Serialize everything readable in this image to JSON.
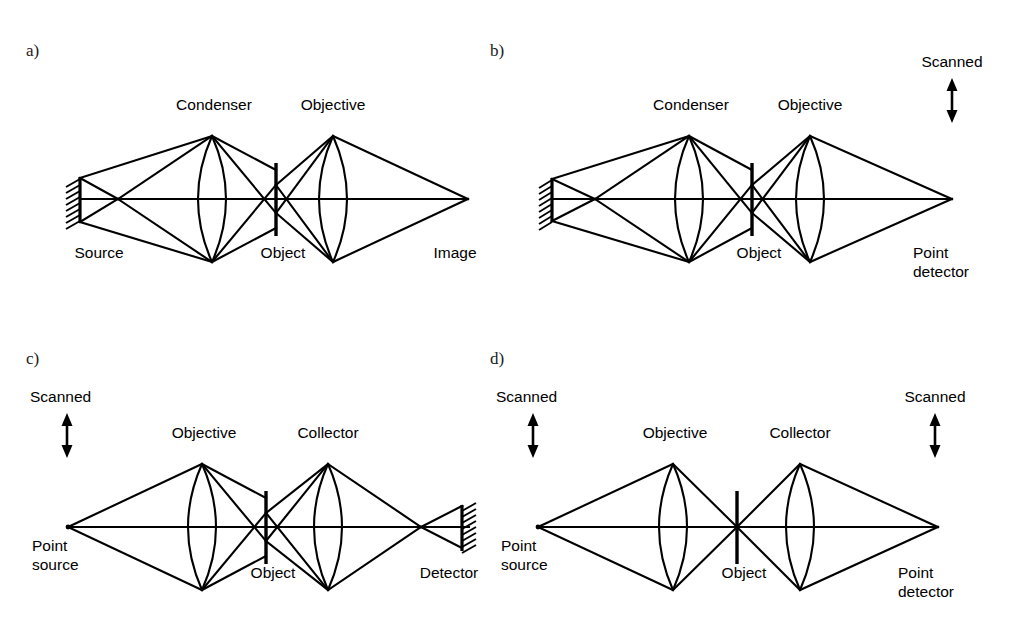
{
  "figure": {
    "background_color": "#ffffff",
    "ink_color": "#000000",
    "width": 1018,
    "height": 630
  },
  "panels": [
    {
      "id": "a",
      "letter": "a)",
      "name": "conventional-microscope",
      "labels": {
        "source": "Source",
        "condenser": "Condenser",
        "object": "Object",
        "objective": "Objective",
        "image": "Image"
      },
      "elements": [
        {
          "kind": "extended-source",
          "label": "Source"
        },
        {
          "kind": "lens",
          "label": "Condenser"
        },
        {
          "kind": "object-plane",
          "label": "Object"
        },
        {
          "kind": "lens",
          "label": "Objective"
        },
        {
          "kind": "image-point",
          "label": "Image"
        }
      ],
      "scanned": []
    },
    {
      "id": "b",
      "letter": "b)",
      "name": "scanned-point-detector-microscope",
      "labels": {
        "condenser": "Condenser",
        "object": "Object",
        "objective": "Objective",
        "point_detector": "Point\ndetector",
        "point_detector_line1": "Point",
        "point_detector_line2": "detector",
        "scanned": "Scanned"
      },
      "elements": [
        {
          "kind": "extended-source",
          "label": ""
        },
        {
          "kind": "lens",
          "label": "Condenser"
        },
        {
          "kind": "object-plane",
          "label": "Object"
        },
        {
          "kind": "lens",
          "label": "Objective"
        },
        {
          "kind": "point-detector",
          "label": "Point detector"
        }
      ],
      "scanned": [
        {
          "position": "right",
          "label": "Scanned",
          "arrow": "double-headed-vertical"
        }
      ]
    },
    {
      "id": "c",
      "letter": "c)",
      "name": "scanning-microscope-large-detector",
      "labels": {
        "point_source": "Point\nsource",
        "point_source_line1": "Point",
        "point_source_line2": "source",
        "objective": "Objective",
        "object": "Object",
        "collector": "Collector",
        "detector": "Detector",
        "scanned": "Scanned"
      },
      "elements": [
        {
          "kind": "point-source",
          "label": "Point source"
        },
        {
          "kind": "lens",
          "label": "Objective"
        },
        {
          "kind": "object-plane",
          "label": "Object"
        },
        {
          "kind": "lens",
          "label": "Collector"
        },
        {
          "kind": "extended-detector",
          "label": "Detector"
        }
      ],
      "scanned": [
        {
          "position": "left",
          "label": "Scanned",
          "arrow": "double-headed-vertical"
        }
      ]
    },
    {
      "id": "d",
      "letter": "d)",
      "name": "confocal-scanning-microscope",
      "labels": {
        "point_source": "Point\nsource",
        "point_source_line1": "Point",
        "point_source_line2": "source",
        "objective": "Objective",
        "object": "Object",
        "collector": "Collector",
        "point_detector": "Point\ndetector",
        "point_detector_line1": "Point",
        "point_detector_line2": "detector",
        "scanned": "Scanned"
      },
      "elements": [
        {
          "kind": "point-source",
          "label": "Point source"
        },
        {
          "kind": "lens",
          "label": "Objective"
        },
        {
          "kind": "object-plane",
          "label": "Object"
        },
        {
          "kind": "lens",
          "label": "Collector"
        },
        {
          "kind": "point-detector",
          "label": "Point detector"
        }
      ],
      "scanned": [
        {
          "position": "left",
          "label": "Scanned",
          "arrow": "double-headed-vertical"
        },
        {
          "position": "right",
          "label": "Scanned",
          "arrow": "double-headed-vertical"
        }
      ]
    }
  ]
}
